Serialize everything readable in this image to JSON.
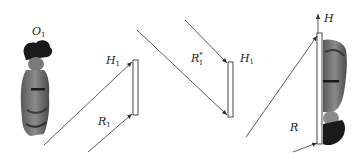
{
  "figure": {
    "panels": [
      {
        "id": "recording-h1",
        "labels": {
          "object": {
            "base": "O",
            "sub": "1"
          },
          "hologram": {
            "base": "H",
            "sub": "1"
          },
          "reference": {
            "base": "R",
            "sub": "1"
          }
        }
      },
      {
        "id": "reconstruction-h1",
        "labels": {
          "reference_conjugate": {
            "base": "R",
            "sub": "1",
            "sup": "*"
          },
          "hologram": {
            "base": "H",
            "sub": "1"
          }
        }
      },
      {
        "id": "recording-h",
        "labels": {
          "hologram": {
            "base": "H"
          },
          "reference": {
            "base": "R"
          }
        }
      }
    ],
    "colors": {
      "line": "#333333",
      "background": "#ffffff"
    }
  }
}
